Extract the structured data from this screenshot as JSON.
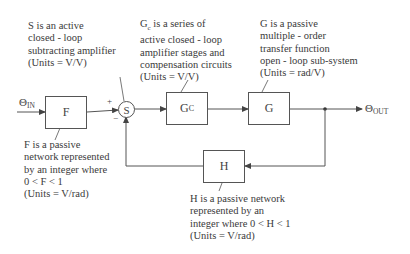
{
  "diagram": {
    "type": "feedback-control-block-diagram",
    "signals": {
      "input": {
        "symbol": "Θ",
        "subscript": "IN"
      },
      "output": {
        "symbol": "Θ",
        "subscript": "OUT"
      }
    },
    "blocks": {
      "F": {
        "label": "F"
      },
      "S": {
        "label": "S",
        "plus_sign": "+",
        "minus_sign": "−"
      },
      "Gc": {
        "label": "G",
        "subscript": "C"
      },
      "G": {
        "label": "G"
      },
      "H": {
        "label": "H"
      }
    },
    "notes": {
      "S": [
        "S is an active",
        "closed - loop",
        "subtracting amplifier",
        "(Units = V/V)"
      ],
      "Gc": [
        "G",
        "c",
        " is a series of",
        "active closed - loop",
        "amplifier stages and",
        "compensation circuits",
        "(Units = V/V)"
      ],
      "G": [
        "G is a passive",
        "multiple - order",
        "transfer function",
        "open - loop sub-system",
        "(Units = rad/V)"
      ],
      "F": [
        "F is a passive",
        "network represented",
        "by an integer where",
        "0 < F < 1",
        "(Units = V/rad)"
      ],
      "H": [
        "H is a passive network",
        "represented by an",
        "integer where 0 < H < 1",
        "(Units = V/rad)"
      ]
    },
    "colors": {
      "line": "#555555",
      "text": "#3a3a3a",
      "background": "#ffffff"
    }
  }
}
